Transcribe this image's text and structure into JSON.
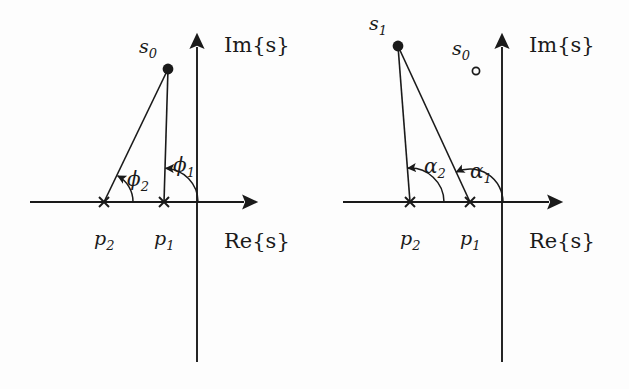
{
  "figure": {
    "type": "root-locus-angle-condition",
    "background_color": "#fdfdfd",
    "ink_color": "#1a1a1a",
    "panels": [
      {
        "id": "left",
        "name": "panel-left",
        "axes": {
          "real_label": "Re{s}",
          "imag_label": "Im{s}",
          "origin": {
            "x": 197,
            "y": 202
          },
          "real_axis": {
            "x1": 30,
            "y1": 202,
            "x2": 248,
            "y2": 202
          },
          "imag_axis": {
            "x1": 197,
            "y1": 362,
            "x2": 197,
            "y2": 42
          }
        },
        "poles": [
          {
            "label": "p_1",
            "label_base": "p",
            "label_sub": "1",
            "x": 164,
            "y": 202,
            "marker": "cross"
          },
          {
            "label": "p_2",
            "label_base": "p",
            "label_sub": "2",
            "x": 104,
            "y": 202,
            "marker": "cross"
          }
        ],
        "test_points": [
          {
            "label": "s_0",
            "label_base": "s",
            "label_sub": "0",
            "x": 168,
            "y": 69,
            "marker": "filled-dot"
          }
        ],
        "vectors": [
          {
            "from": "p_1",
            "to": "s_0",
            "x1": 164,
            "y1": 202,
            "x2": 168,
            "y2": 69
          },
          {
            "from": "p_2",
            "to": "s_0",
            "x1": 104,
            "y1": 202,
            "x2": 168,
            "y2": 69
          }
        ],
        "angles": [
          {
            "label": "phi_1",
            "label_base": "ϕ",
            "label_sub": "1",
            "vertex": "p_1",
            "glyph": "ϕ",
            "sub": "1",
            "label_x": 183,
            "label_y": 165,
            "radius": 34,
            "start_deg": 0,
            "end_deg": 88
          },
          {
            "label": "phi_2",
            "label_base": "ϕ",
            "label_sub": "2",
            "vertex": "p_2",
            "glyph": "ϕ",
            "sub": "2",
            "label_x": 137,
            "label_y": 178,
            "radius": 29,
            "start_deg": 0,
            "end_deg": 64
          }
        ]
      },
      {
        "id": "right",
        "name": "panel-right",
        "axes": {
          "real_label": "Re{s}",
          "imag_label": "Im{s}",
          "origin": {
            "x": 502,
            "y": 202
          },
          "real_axis": {
            "x1": 343,
            "y1": 202,
            "x2": 553,
            "y2": 202
          },
          "imag_axis": {
            "x1": 502,
            "y1": 362,
            "x2": 502,
            "y2": 42
          }
        },
        "poles": [
          {
            "label": "p_1",
            "label_base": "p",
            "label_sub": "1",
            "x": 470,
            "y": 202,
            "marker": "cross"
          },
          {
            "label": "p_2",
            "label_base": "p",
            "label_sub": "2",
            "x": 410,
            "y": 202,
            "marker": "cross"
          }
        ],
        "test_points": [
          {
            "label": "s_1",
            "label_base": "s",
            "label_sub": "1",
            "x": 398,
            "y": 46,
            "marker": "filled-dot"
          },
          {
            "label": "s_0",
            "label_base": "s",
            "label_sub": "0",
            "x": 476,
            "y": 71,
            "marker": "open-circle"
          }
        ],
        "vectors": [
          {
            "from": "p_1",
            "to": "s_1",
            "x1": 470,
            "y1": 202,
            "x2": 398,
            "y2": 46
          },
          {
            "from": "p_2",
            "to": "s_1",
            "x1": 410,
            "y1": 202,
            "x2": 398,
            "y2": 46
          }
        ],
        "angles": [
          {
            "label": "alpha_1",
            "label_base": "α",
            "label_sub": "1",
            "vertex": "p_1",
            "glyph": "α",
            "sub": "1",
            "label_x": 481,
            "label_y": 170,
            "radius": 33,
            "start_deg": 0,
            "end_deg": 115
          },
          {
            "label": "alpha_2",
            "label_base": "α",
            "label_sub": "2",
            "vertex": "p_2",
            "glyph": "α",
            "sub": "2",
            "label_x": 436,
            "label_y": 165,
            "radius": 34,
            "start_deg": 0,
            "end_deg": 94
          }
        ]
      }
    ]
  }
}
